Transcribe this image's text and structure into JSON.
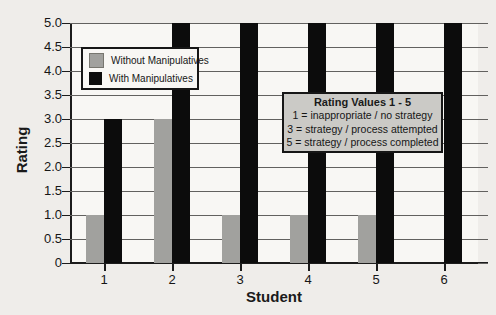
{
  "chart_data": {
    "type": "bar",
    "title": "",
    "xlabel": "Student",
    "ylabel": "Rating",
    "categories": [
      "1",
      "2",
      "3",
      "4",
      "5",
      "6"
    ],
    "series": [
      {
        "name": "Without Manipulatives",
        "color": "#a1a19e",
        "values": [
          1,
          3,
          1,
          1,
          1,
          0
        ]
      },
      {
        "name": "With Manipulatives",
        "color": "#0c0c0c",
        "values": [
          3,
          5,
          5,
          5,
          5,
          5
        ]
      }
    ],
    "ylim": [
      0,
      5
    ],
    "ytick_interval": 0.5,
    "ytick_labels": [
      "0",
      "0.5",
      "1.0",
      "1.5",
      "2.0",
      "2.5",
      "3.0",
      "3.5",
      "4.0",
      "4.5",
      "5.0"
    ],
    "grid": "horizontal",
    "legend_position": "top-left",
    "annotation_box": {
      "background": "#cbcac6",
      "title": "Rating Values 1 - 5",
      "lines": [
        "1 = inappropriate / no strategy",
        "3 = strategy / process attempted",
        "5 = strategy / process completed"
      ]
    }
  }
}
